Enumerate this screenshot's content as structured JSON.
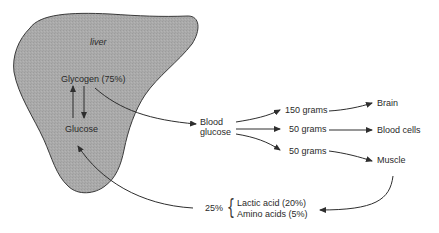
{
  "diagram": {
    "organ_label": "liver",
    "liver_fill": "#a9a9a9",
    "liver_outline": "#3a3a3a",
    "arrow_color": "#2e2e2e",
    "nodes": {
      "glycogen": "Glycogen (75%)",
      "glucose": "Glucose",
      "blood_glucose_line1": "Blood",
      "blood_glucose_line2": "glucose",
      "amount_brain": "150 grams",
      "amount_blood_cells": "50 grams",
      "amount_muscle": "50 grams",
      "brain": "Brain",
      "blood_cells": "Blood cells",
      "muscle": "Muscle",
      "return_percent": "25%",
      "lactic_acid": "Lactic acid (20%)",
      "amino_acids": "Amino acids (5%)"
    },
    "brace_glyph": "{"
  }
}
